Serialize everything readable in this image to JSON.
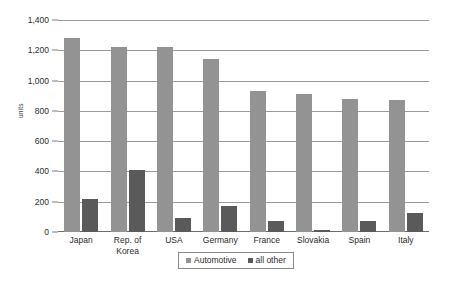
{
  "chart_data": {
    "type": "bar",
    "title": "",
    "xlabel": "",
    "ylabel": "units",
    "ylim": [
      0,
      1400
    ],
    "ytick_values": [
      0,
      200,
      400,
      600,
      800,
      1000,
      1200,
      1400
    ],
    "ytick_labels": [
      "0",
      "200",
      "400",
      "600",
      "800",
      "1,000",
      "1,200",
      "1,400"
    ],
    "grid": true,
    "legend_position": "bottom",
    "categories": [
      "Japan",
      "Rep. of\nKorea",
      "USA",
      "Germany",
      "France",
      "Slovakia",
      "Spain",
      "Italy"
    ],
    "series": [
      {
        "name": "Automotive",
        "color": "#939393",
        "values": [
          1280,
          1220,
          1220,
          1145,
          930,
          910,
          880,
          870
        ]
      },
      {
        "name": "all other",
        "color": "#5a5a5a",
        "values": [
          215,
          410,
          90,
          170,
          70,
          15,
          75,
          125
        ]
      }
    ]
  },
  "legend": {
    "items": [
      {
        "label": "Automotive"
      },
      {
        "label": "all other"
      }
    ]
  }
}
